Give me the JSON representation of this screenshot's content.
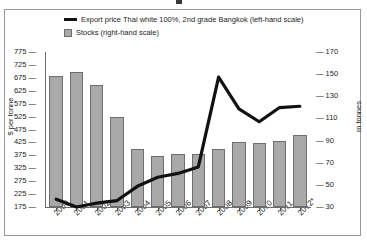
{
  "figure": {
    "frame_border_color": "#9a9a9a",
    "background": "#ffffff"
  },
  "legend": {
    "position": "top-left-inside",
    "items": [
      {
        "marker": "line",
        "color": "#111111",
        "label": "Export price Thai white 100%, 2nd grade Bangkok (left-hand scale)"
      },
      {
        "marker": "swatch",
        "color": "#a9a9a9",
        "label": "Stocks (right-hand scale)"
      }
    ]
  },
  "axes": {
    "left": {
      "title": "$ per tonne",
      "ticks": [
        "775",
        "725",
        "675",
        "625",
        "575",
        "525",
        "475",
        "425",
        "375",
        "325",
        "275",
        "225",
        "175"
      ]
    },
    "right": {
      "title": "m tonnes",
      "ticks": [
        "170",
        "150",
        "130",
        "110",
        "90",
        "70",
        "50",
        "30"
      ]
    },
    "bottom": {
      "ticks": [
        "2000",
        "2001",
        "2002",
        "2003",
        "2004",
        "2005",
        "2006",
        "2007",
        "2008",
        "2009",
        "2010",
        "2011",
        "2012*"
      ]
    }
  },
  "chart_data": {
    "type": "bar",
    "title": "",
    "xlabel": "",
    "ylabel": "$ per tonne",
    "y2label": "m tonnes",
    "ylim": [
      175,
      775
    ],
    "y2lim": [
      30,
      170
    ],
    "grid": false,
    "legend_position": "top-left",
    "categories": [
      "2000",
      "2001",
      "2002",
      "2003",
      "2004",
      "2005",
      "2006",
      "2007",
      "2008",
      "2009",
      "2010",
      "2011",
      "2012*"
    ],
    "series": [
      {
        "name": "Export price Thai white 100%, 2nd grade Bangkok (left-hand scale)",
        "type": "line",
        "axis": "left",
        "unit": "$ per tonne",
        "color": "#111111",
        "values": [
          205,
          175,
          190,
          200,
          255,
          290,
          305,
          330,
          678,
          555,
          505,
          560,
          565
        ]
      },
      {
        "name": "Stocks (right-hand scale)",
        "type": "bar",
        "axis": "right",
        "unit": "m tonnes",
        "color": "#a9a9a9",
        "values": [
          148,
          152,
          140,
          111,
          82,
          76,
          78,
          78,
          82,
          89,
          88,
          90,
          95
        ]
      }
    ]
  }
}
